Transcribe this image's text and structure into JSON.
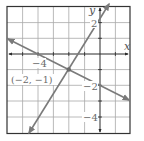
{
  "figure": {
    "type": "coordinate-graph",
    "axes": {
      "x_label": "x",
      "y_label": "y",
      "x_range": [
        -6,
        2
      ],
      "y_range": [
        -5,
        3
      ],
      "grid": true,
      "grid_step": 1
    },
    "tick_labels": {
      "x": [
        {
          "value": -4,
          "text": "−4"
        }
      ],
      "y": [
        {
          "value": 2,
          "text": "2"
        },
        {
          "value": -2,
          "text": "−2"
        },
        {
          "value": -4,
          "text": "−4"
        }
      ]
    },
    "lines": [
      {
        "name": "line-1",
        "equation": "y = 1.5x + 2",
        "slope": 1.5,
        "intercept": 2,
        "from": [
          -4.6,
          -4.9
        ],
        "to": [
          0.6,
          2.9
        ]
      },
      {
        "name": "line-2",
        "equation": "y = -0.5x - 2",
        "slope": -0.5,
        "intercept": -2,
        "from": [
          -6,
          1
        ],
        "to": [
          2,
          -3
        ]
      }
    ],
    "intersection": {
      "x": -2,
      "y": -1,
      "label": "(−2, −1)"
    },
    "colors": {
      "grid": "#9a9a9a",
      "border": "#333333",
      "axes": "#2a2a2a",
      "lines": "#7a7a7a",
      "labels": "#6a6a6a"
    }
  }
}
